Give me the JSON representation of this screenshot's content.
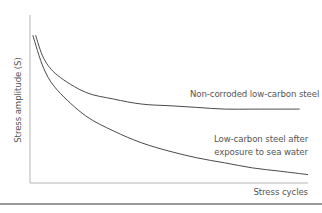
{
  "chart_data": {
    "type": "line",
    "title": "",
    "xlabel": "Stress cycles",
    "ylabel": "Stress amplitude (S)",
    "ticks": "none (qualitative axes)",
    "grid": false,
    "legend": "inline labels next to curves",
    "series": [
      {
        "name": "Non-corroded low-carbon steel",
        "shape": "decaying curve levelling off to a fatigue limit",
        "x": [
          0.02,
          0.05,
          0.1,
          0.2,
          0.3,
          0.4,
          0.5,
          0.6,
          0.7,
          0.8,
          0.9,
          0.97
        ],
        "values": [
          0.88,
          0.74,
          0.64,
          0.54,
          0.5,
          0.47,
          0.46,
          0.45,
          0.44,
          0.44,
          0.44,
          0.44
        ]
      },
      {
        "name": "Low-carbon steel after exposure to sea water",
        "shape": "continuously decaying curve with no fatigue limit",
        "x": [
          0.01,
          0.05,
          0.1,
          0.2,
          0.3,
          0.4,
          0.5,
          0.6,
          0.7,
          0.8,
          0.9,
          1.0
        ],
        "values": [
          0.88,
          0.68,
          0.55,
          0.4,
          0.31,
          0.24,
          0.19,
          0.15,
          0.12,
          0.09,
          0.07,
          0.05
        ]
      }
    ],
    "xlim": [
      0,
      1
    ],
    "ylim": [
      0,
      1
    ]
  },
  "labels": {
    "ylabel": "Stress amplitude (S)",
    "xlabel": "Stress cycles",
    "series1": "Non-corroded low-carbon steel",
    "series2_line1": "Low-carbon steel after",
    "series2_line2": "exposure to sea water"
  },
  "colors": {
    "axis": "#b5b5b5",
    "curve": "#4a4a4a",
    "text": "#555555",
    "rule": "#9a9a9a"
  }
}
